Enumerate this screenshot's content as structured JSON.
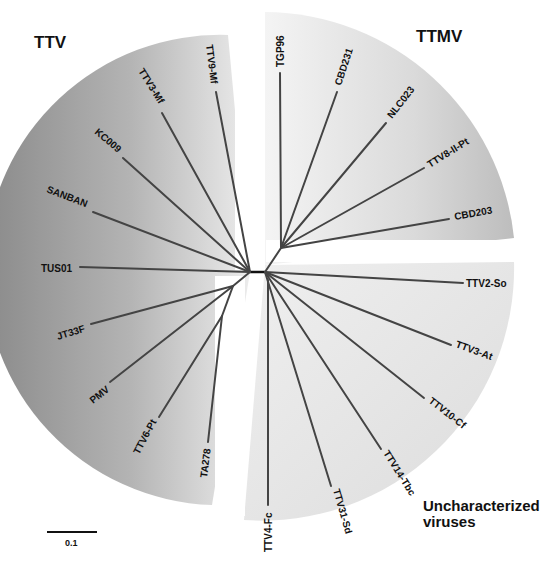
{
  "figure": {
    "type": "unrooted phylogenetic tree",
    "groups": [
      {
        "name": "TTV",
        "label": "TTV",
        "color": "#8f8f8f"
      },
      {
        "name": "TTMV",
        "label": "TTMV",
        "color": "#c4c4c4"
      },
      {
        "name": "Uncharacterized",
        "label_line1": "Uncharacterized",
        "label_line2": "viruses",
        "color": "#e2e2e2"
      }
    ],
    "leaves": {
      "ttv": [
        "TTV9-Mf",
        "TTV3-Mf",
        "KC009",
        "SANBAN",
        "TUS01",
        "JT33F",
        "PMV",
        "TTV6-Pt",
        "TA278"
      ],
      "ttmv": [
        "TGP96",
        "CBD231",
        "NLC023",
        "TTV8-II-Pt",
        "CBD203"
      ],
      "uncharacterized": [
        "TTV2-So",
        "TTV3-At",
        "TTV10-Cf",
        "TTV14-Tbc",
        "TTV31-Sd",
        "TTV4-Fc"
      ]
    },
    "scale_bar": {
      "label": "0.1"
    }
  }
}
